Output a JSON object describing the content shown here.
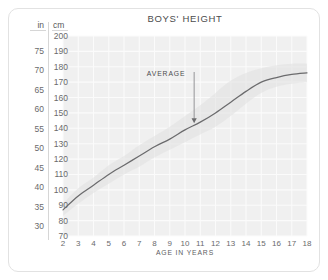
{
  "chart_data": {
    "type": "line",
    "title": "BOYS' HEIGHT",
    "xlabel": "AGE IN YEARS",
    "ylabel_primary": "cm",
    "ylabel_secondary": "in",
    "grid": true,
    "legend": "none",
    "xlim": [
      2,
      18
    ],
    "ylim_cm": [
      70,
      200
    ],
    "ylim_in": [
      27.6,
      78.7
    ],
    "x_ticks": [
      2,
      3,
      4,
      5,
      6,
      7,
      8,
      9,
      10,
      11,
      12,
      13,
      14,
      15,
      16,
      17,
      18
    ],
    "y_ticks_cm": [
      70,
      80,
      90,
      100,
      110,
      120,
      130,
      140,
      150,
      160,
      170,
      180,
      190,
      200
    ],
    "y_ticks_in": [
      30,
      35,
      40,
      45,
      50,
      55,
      60,
      65,
      70,
      75
    ],
    "x": [
      2,
      3,
      4,
      5,
      6,
      7,
      8,
      9,
      10,
      11,
      12,
      13,
      14,
      15,
      16,
      17,
      18
    ],
    "series": [
      {
        "name": "AVERAGE",
        "unit": "cm",
        "values": [
          87,
          96,
          103,
          110,
          116,
          122,
          128,
          133,
          139,
          144,
          150,
          157,
          164,
          170,
          173,
          175,
          176
        ]
      }
    ],
    "band": {
      "name": "normal range",
      "unit": "cm",
      "upper": [
        91,
        101,
        108,
        116,
        122,
        129,
        135,
        141,
        148,
        155,
        163,
        171,
        176,
        179,
        181,
        182,
        182
      ],
      "lower": [
        83,
        91,
        98,
        104,
        110,
        115,
        121,
        126,
        131,
        136,
        141,
        148,
        156,
        163,
        167,
        169,
        170
      ]
    },
    "annotations": [
      {
        "label": "AVERAGE",
        "x": 10.6,
        "y_cm": 143,
        "arrow": "down"
      }
    ],
    "colors": {
      "plot_background": "#f0f0f0",
      "gridline": "#fbfbfb",
      "curve": "#6b6b6d",
      "band": "#e2e2e2",
      "card_border": "#e2e2e2",
      "text": "#59595b",
      "page_background": "#ffffff"
    }
  },
  "axes": {
    "in_header": "in",
    "cm_header": "cm"
  }
}
